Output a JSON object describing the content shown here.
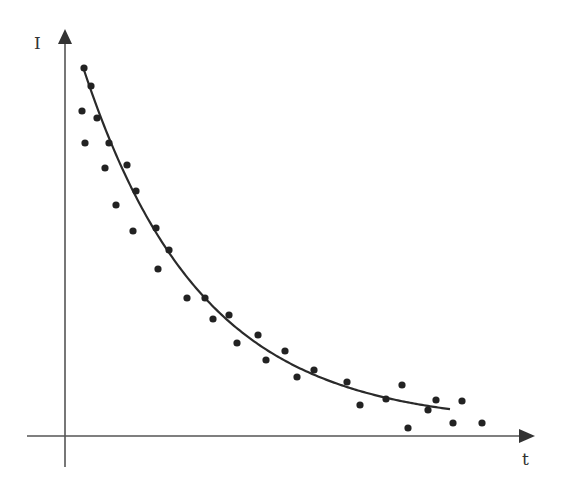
{
  "chart_data": {
    "type": "scatter",
    "title": "",
    "xlabel": "t",
    "ylabel": "I",
    "grid": false,
    "legend": null,
    "pixel_frame": {
      "origin": [
        65,
        436
      ],
      "x_axis": {
        "from": 27,
        "to": 534,
        "y": 436
      },
      "y_axis": {
        "x": 65,
        "from": 467,
        "to": 30
      }
    },
    "points_px": [
      [
        84,
        68
      ],
      [
        91,
        86
      ],
      [
        82,
        111
      ],
      [
        97,
        118
      ],
      [
        85,
        143
      ],
      [
        109,
        143
      ],
      [
        105,
        168
      ],
      [
        127,
        165
      ],
      [
        136,
        191
      ],
      [
        116,
        205
      ],
      [
        133,
        231
      ],
      [
        156,
        228
      ],
      [
        169,
        250
      ],
      [
        158,
        269
      ],
      [
        187,
        298
      ],
      [
        205,
        298
      ],
      [
        213,
        319
      ],
      [
        229,
        315
      ],
      [
        237,
        343
      ],
      [
        258,
        335
      ],
      [
        266,
        360
      ],
      [
        285,
        351
      ],
      [
        297,
        377
      ],
      [
        314,
        370
      ],
      [
        347,
        382
      ],
      [
        360,
        405
      ],
      [
        386,
        399
      ],
      [
        402,
        385
      ],
      [
        408,
        428
      ],
      [
        428,
        410
      ],
      [
        436,
        400
      ],
      [
        453,
        423
      ],
      [
        462,
        401
      ],
      [
        482,
        423
      ]
    ],
    "fit_curve": {
      "type": "exponential_decay",
      "x_start_px": 84,
      "x_end_px": 451,
      "asymptote_px": 425,
      "amplitude_px": 355,
      "rate_per_px": 0.0085
    },
    "colors": {
      "points": "#222222",
      "curve": "#2a2a2a",
      "axes": "#555555"
    }
  },
  "labels": {
    "y_axis": "I",
    "x_axis": "t"
  }
}
